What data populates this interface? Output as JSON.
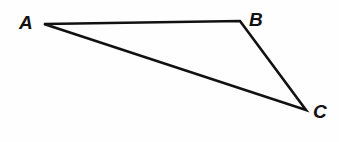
{
  "figure": {
    "kind": "geometry-diagram",
    "shape": "triangle",
    "background_color": "#fefefe",
    "stroke_color": "#111111",
    "stroke_width": 2.6,
    "canvas": {
      "width": 339,
      "height": 142
    },
    "vertices": [
      {
        "id": "A",
        "label": "A",
        "x": 44,
        "y": 24,
        "label_x": 19,
        "label_y": 13
      },
      {
        "id": "B",
        "label": "B",
        "x": 240,
        "y": 21,
        "label_x": 249,
        "label_y": 10
      },
      {
        "id": "C",
        "label": "C",
        "x": 306,
        "y": 110,
        "label_x": 313,
        "label_y": 102
      }
    ],
    "edges": [
      {
        "id": "AB",
        "from": "A",
        "to": "B"
      },
      {
        "id": "BC",
        "from": "B",
        "to": "C"
      },
      {
        "id": "CA",
        "from": "C",
        "to": "A"
      }
    ],
    "path": "M 44 24 L 240 21 L 306 110 Z"
  }
}
